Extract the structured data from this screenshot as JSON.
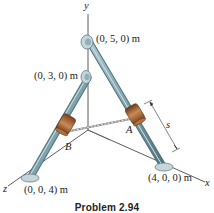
{
  "figure": {
    "caption": "Problem 2.94",
    "axes": {
      "x": "x",
      "y": "y",
      "z": "z"
    },
    "points": {
      "top": "(0, 5, 0) m",
      "mid": "(0, 3, 0) m",
      "x_base": "(4, 0, 0) m",
      "z_base": "(0, 0, 4) m"
    },
    "collars": {
      "a": "A",
      "b": "B"
    },
    "dimension": "s",
    "colors": {
      "rod": "#7fa3ad",
      "rod_dark": "#4f727c",
      "collar": "#9a5a2e",
      "collar_light": "#c98a55",
      "base": "#c7d5da",
      "axis": "#333333"
    }
  }
}
